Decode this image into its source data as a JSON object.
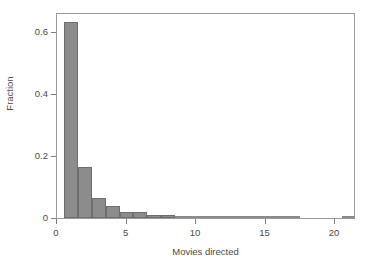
{
  "chart_data": {
    "type": "bar",
    "title": "",
    "subtitle": "",
    "xlabel": "Movies directed",
    "ylabel": "Fraction",
    "xlim": [
      0,
      21.5
    ],
    "ylim": [
      0,
      0.665
    ],
    "grid": false,
    "legend": null,
    "bin_width": 1,
    "bar_color": "#8c8c8c",
    "bar_edge_color": "#6e6e6e",
    "axis_color": "#9a9a9a",
    "background": "#ffffff",
    "xticks": [
      {
        "value": 0,
        "label": "0"
      },
      {
        "value": 5,
        "label": "5"
      },
      {
        "value": 10,
        "label": "10"
      },
      {
        "value": 15,
        "label": "15"
      },
      {
        "value": 20,
        "label": "20"
      }
    ],
    "yticks": [
      {
        "value": 0,
        "label": "0"
      },
      {
        "value": 0.2,
        "label": "0.2"
      },
      {
        "value": 0.4,
        "label": "0.4"
      },
      {
        "value": 0.6,
        "label": "0.6"
      }
    ],
    "categories": [
      1,
      2,
      3,
      4,
      5,
      6,
      7,
      8,
      9,
      10,
      11,
      12,
      13,
      14,
      15,
      16,
      17,
      21
    ],
    "values": [
      0.632,
      0.165,
      0.064,
      0.039,
      0.019,
      0.019,
      0.009,
      0.01,
      0.007,
      0.006,
      0.004,
      0.002,
      0.002,
      0.001,
      0.001,
      0.001,
      0.001,
      0.001
    ],
    "bars": [
      {
        "x0": 0.5,
        "x1": 1.5,
        "value": 0.632
      },
      {
        "x0": 1.5,
        "x1": 2.5,
        "value": 0.165
      },
      {
        "x0": 2.5,
        "x1": 3.5,
        "value": 0.064
      },
      {
        "x0": 3.5,
        "x1": 4.5,
        "value": 0.039
      },
      {
        "x0": 4.5,
        "x1": 5.5,
        "value": 0.019
      },
      {
        "x0": 5.5,
        "x1": 6.5,
        "value": 0.019
      },
      {
        "x0": 6.5,
        "x1": 7.5,
        "value": 0.009
      },
      {
        "x0": 7.5,
        "x1": 8.5,
        "value": 0.01
      },
      {
        "x0": 8.5,
        "x1": 9.5,
        "value": 0.007
      },
      {
        "x0": 9.5,
        "x1": 10.5,
        "value": 0.006
      },
      {
        "x0": 10.5,
        "x1": 11.5,
        "value": 0.004
      },
      {
        "x0": 11.5,
        "x1": 12.5,
        "value": 0.002
      },
      {
        "x0": 12.5,
        "x1": 13.5,
        "value": 0.002
      },
      {
        "x0": 13.5,
        "x1": 14.5,
        "value": 0.001
      },
      {
        "x0": 14.5,
        "x1": 15.5,
        "value": 0.001
      },
      {
        "x0": 15.5,
        "x1": 16.5,
        "value": 0.001
      },
      {
        "x0": 16.5,
        "x1": 17.5,
        "value": 0.001
      },
      {
        "x0": 20.5,
        "x1": 21.5,
        "value": 0.001
      }
    ]
  }
}
